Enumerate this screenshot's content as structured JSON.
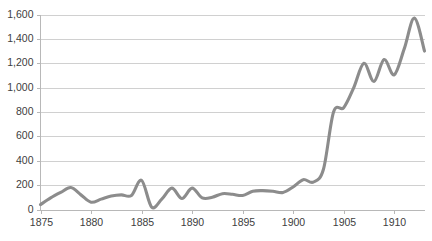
{
  "chart_data": {
    "type": "line",
    "title": "",
    "subtitle": "",
    "xlabel": "",
    "ylabel": "",
    "xlim": [
      1875,
      1913
    ],
    "ylim": [
      0,
      1600
    ],
    "grid": true,
    "legend": false,
    "legend_position": "none",
    "y_ticks": [
      0,
      200,
      400,
      600,
      800,
      1000,
      1200,
      1400,
      1600
    ],
    "y_tick_labels": [
      "0",
      "200",
      "400",
      "600",
      "800",
      "1,000",
      "1,200",
      "1,400",
      "1,600"
    ],
    "x_ticks": [
      1875,
      1880,
      1885,
      1890,
      1895,
      1900,
      1905,
      1910
    ],
    "x_tick_labels": [
      "1875",
      "1880",
      "1885",
      "1890",
      "1895",
      "1900",
      "1905",
      "1910"
    ],
    "x": [
      1875,
      1876,
      1877,
      1878,
      1879,
      1880,
      1881,
      1882,
      1883,
      1884,
      1885,
      1886,
      1887,
      1888,
      1889,
      1890,
      1891,
      1892,
      1893,
      1894,
      1895,
      1896,
      1897,
      1898,
      1899,
      1900,
      1901,
      1902,
      1903,
      1904,
      1905,
      1906,
      1907,
      1908,
      1909,
      1910,
      1911,
      1912,
      1913
    ],
    "series": [
      {
        "name": "",
        "color": "#8c8c8c",
        "values": [
          40,
          95,
          140,
          180,
          120,
          60,
          85,
          110,
          120,
          115,
          240,
          20,
          85,
          175,
          90,
          175,
          95,
          100,
          130,
          125,
          115,
          150,
          155,
          150,
          140,
          185,
          245,
          225,
          330,
          800,
          835,
          1000,
          1200,
          1050,
          1230,
          1105,
          1320,
          1570,
          1300
        ]
      }
    ]
  }
}
